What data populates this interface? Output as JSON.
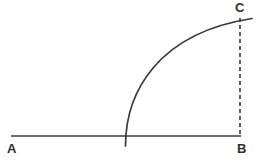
{
  "figure": {
    "background_color": "#ffffff",
    "stroke_color": "#3a3a3a",
    "labels": {
      "a": "A",
      "b": "B",
      "c": "C"
    },
    "label_color": "#2f2f2f"
  },
  "chart_data": {
    "type": "diagram",
    "title": "",
    "xlabel": "",
    "ylabel": "",
    "coordinate_space": {
      "width": 263,
      "height": 165,
      "units": "pixels",
      "origin": "top-left"
    },
    "points": [
      {
        "name": "A",
        "label": "A",
        "x": 11,
        "y": 136,
        "label_x": 11,
        "label_y": 150
      },
      {
        "name": "B",
        "label": "B",
        "x": 241,
        "y": 136,
        "label_x": 241,
        "label_y": 150
      },
      {
        "name": "C",
        "label": "C",
        "x": 241,
        "y": 18,
        "label_x": 239,
        "label_y": 9
      },
      {
        "name": "P",
        "label": "",
        "x": 125,
        "y": 136,
        "label_x": 0,
        "label_y": 0
      }
    ],
    "segments": [
      {
        "name": "baseline-AB",
        "from": "A",
        "to": "B",
        "style": "solid",
        "x1": 11,
        "y1": 136,
        "x2": 241,
        "y2": 136,
        "stroke": "#3a3a3a",
        "stroke_width": 1.6
      },
      {
        "name": "vertical-CB",
        "from": "C",
        "to": "B",
        "style": "dashed",
        "x1": 240,
        "y1": 18,
        "x2": 240,
        "y2": 137,
        "stroke": "#3a3a3a",
        "stroke_width": 1.6,
        "dash_pattern": "4 3"
      }
    ],
    "curves": [
      {
        "name": "quarter-arc",
        "style": "solid",
        "stroke": "#3a3a3a",
        "stroke_width": 1.7,
        "path": "M 125.5 146 C 125.5 92 158 33 252 18.5",
        "start": {
          "x": 125.5,
          "y": 146
        },
        "end": {
          "x": 252,
          "y": 18.5
        },
        "description": "concave-down arc rising from below baseline at x=125 to just past the dashed line at the top"
      }
    ],
    "grid": false,
    "legend": null
  }
}
